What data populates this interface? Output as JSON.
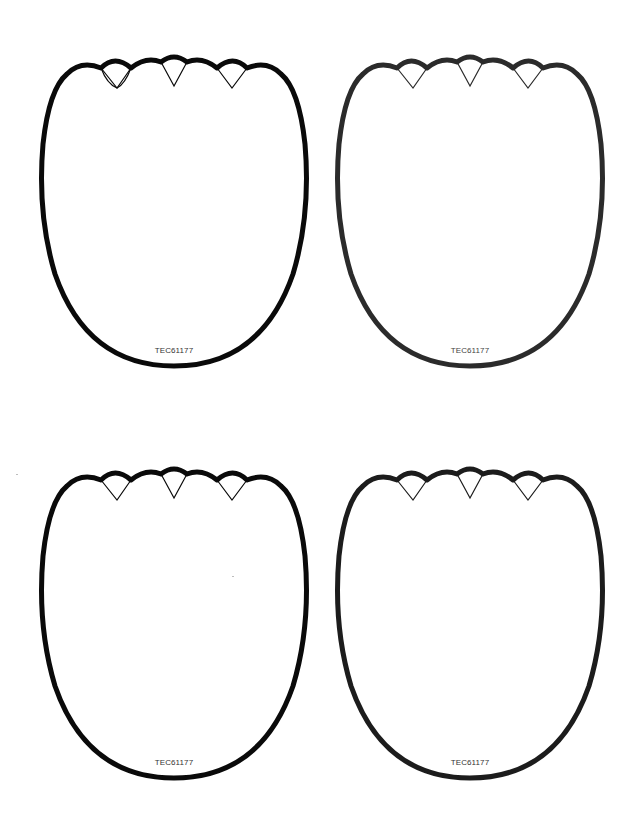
{
  "page": {
    "background": "#ffffff"
  },
  "shapes": [
    {
      "position": "top-left",
      "code": "TEC61177",
      "stroke": "#0a0a0a",
      "text_color": "#333333"
    },
    {
      "position": "top-right",
      "code": "TEC61177",
      "stroke": "#2b2b2b",
      "text_color": "#444444"
    },
    {
      "position": "bottom-left",
      "code": "TEC61177",
      "stroke": "#0a0a0a",
      "text_color": "#333333"
    },
    {
      "position": "bottom-right",
      "code": "TEC61177",
      "stroke": "#1c1c1c",
      "text_color": "#333333"
    }
  ]
}
